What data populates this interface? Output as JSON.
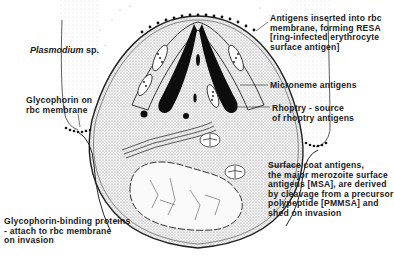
{
  "figure": {
    "organism": {
      "genus": "Plasmodium",
      "suffix": "sp."
    },
    "labels": {
      "resa": "Antigens inserted into rbc\nmembrane, forming RESA\n[ring-infected erythrocyte\nsurface antigen]",
      "microneme": "Microneme antigens",
      "rhoptry": "Rhoptry - source\nof rhoptry antigens",
      "surface_coat": "Surface coat antigens,\nthe major merozoite surface\nantigens [MSA], are derived\nby cleavage from a precursor\npolypeptide [PMMSA] and\nshed on invasion",
      "glycophorin": "Glycophorin on\nrbc membrane",
      "glycophorin_binding": "Glycophorin-binding proteins\n- attach to rbc membrane\non invasion"
    },
    "colors": {
      "ink": "#1a1a1a",
      "stipple": "#7a7a7a",
      "background": "#ffffff"
    }
  }
}
